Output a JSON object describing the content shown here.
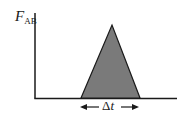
{
  "diagram": {
    "y_axis_label": {
      "main": "F",
      "subscript": "AB"
    },
    "duration_label": {
      "delta": "Δ",
      "var": "t"
    },
    "colors": {
      "fill": "#7a7a7a",
      "stroke": "#1a1a1a",
      "background": "#ffffff"
    },
    "shape": "triangle"
  }
}
